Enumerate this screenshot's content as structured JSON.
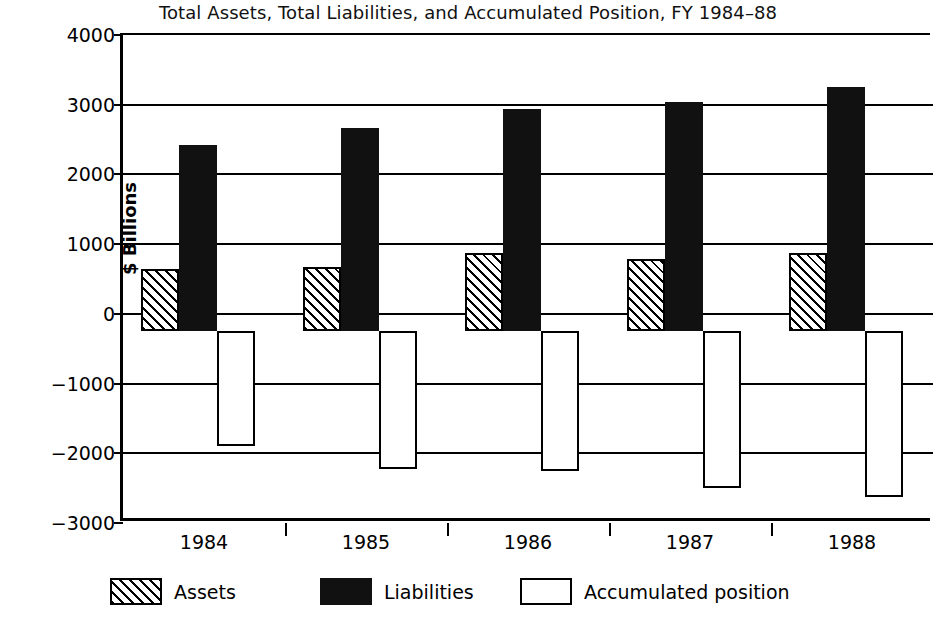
{
  "chart_data": {
    "type": "bar",
    "title": "Total Assets, Total Liabilities, and Accumulated Position, FY 1984–88",
    "xlabel": "",
    "ylabel": "$ Billions",
    "categories": [
      "1984",
      "1985",
      "1986",
      "1987",
      "1988"
    ],
    "ylim": [
      -3000,
      4000
    ],
    "yticks": [
      4000,
      3000,
      2000,
      1000,
      0,
      -1000,
      -2000,
      -3000
    ],
    "ytick_labels": [
      "4000",
      "3000",
      "2000",
      "1000",
      "0",
      "−1000",
      "−2000",
      "−3000"
    ],
    "grid": true,
    "legend_position": "bottom",
    "bar_baseline": -250,
    "series": [
      {
        "name": "Assets",
        "style": "hatched",
        "values": [
          640,
          670,
          870,
          780,
          870
        ]
      },
      {
        "name": "Liabilities",
        "style": "solid-black",
        "values": [
          2420,
          2670,
          2940,
          3040,
          3250
        ]
      },
      {
        "name": "Accumulated position",
        "style": "white-outline",
        "values": [
          -1900,
          -2230,
          -2250,
          -2500,
          -2630
        ]
      }
    ]
  },
  "legend": {
    "items": [
      {
        "label": "Assets",
        "swatch": "hatched"
      },
      {
        "label": "Liabilities",
        "swatch": "solid-black"
      },
      {
        "label": "Accumulated position",
        "swatch": "white-outline"
      }
    ]
  }
}
